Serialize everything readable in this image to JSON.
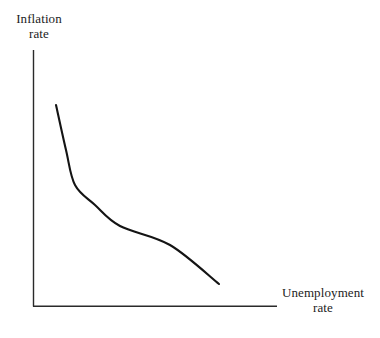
{
  "figure": {
    "title": "",
    "background_color": "#ffffff",
    "axis_color": "#2a2a2a",
    "curve_color": "#141414",
    "text_color": "#1c1c1c"
  },
  "y_axis": {
    "label_line1": "Inflation",
    "label_line2": "rate"
  },
  "x_axis": {
    "label_line1": "Unemployment",
    "label_line2": "rate"
  },
  "chart_data": {
    "type": "line",
    "title": "",
    "xlabel": "Unemployment rate",
    "ylabel": "Inflation rate",
    "xlim": [
      0,
      100
    ],
    "ylim": [
      0,
      100
    ],
    "grid": false,
    "legend": null,
    "axis_ticks": {
      "x": [],
      "y": []
    },
    "series": [
      {
        "name": "Phillips curve",
        "shape": "convex-decreasing",
        "x": [
          9,
          13,
          17,
          25,
          35,
          56,
          76
        ],
        "y": [
          78,
          61,
          47,
          39,
          31,
          23,
          8
        ],
        "points_px": [
          [
            56,
            105
          ],
          [
            66,
            150
          ],
          [
            75,
            185
          ],
          [
            95,
            205
          ],
          [
            120,
            226
          ],
          [
            170,
            245
          ],
          [
            219,
            284
          ]
        ]
      }
    ],
    "annotations": []
  }
}
